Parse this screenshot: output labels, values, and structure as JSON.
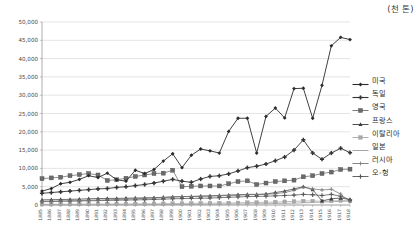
{
  "unit_note": "(천 톤)",
  "chart_data": {
    "type": "line",
    "title": "",
    "subtitle": "",
    "xlabel": "",
    "ylabel": "",
    "unit": "천 톤",
    "ylim": [
      0,
      50000
    ],
    "ytick_step": 5000,
    "ytick_labels": [
      "0",
      "5,000",
      "10,000",
      "15,000",
      "20,000",
      "25,000",
      "30,000",
      "35,000",
      "40,000",
      "45,000",
      "50,000"
    ],
    "grid": true,
    "legend_position": "right",
    "x": [
      1885,
      1886,
      1887,
      1888,
      1889,
      1890,
      1891,
      1892,
      1893,
      1894,
      1895,
      1896,
      1897,
      1898,
      1899,
      1900,
      1901,
      1902,
      1903,
      1904,
      1905,
      1906,
      1907,
      1908,
      1909,
      1910,
      1911,
      1912,
      1913,
      1914,
      1915,
      1916,
      1917,
      1918
    ],
    "xtick_labels": [
      "1885",
      "1886",
      "1887",
      "1888",
      "1889",
      "1890",
      "1891",
      "1892",
      "1893",
      "1894",
      "1895",
      "1896",
      "1897",
      "1898",
      "1899",
      "1900",
      "1901",
      "1902",
      "1903",
      "1904",
      "1905",
      "1906",
      "1907",
      "1908",
      "1909",
      "1910",
      "1911",
      "1912",
      "1913",
      "1914",
      "1915",
      "1916",
      "1917",
      "1918"
    ],
    "series": [
      {
        "name": "미국",
        "marker": "diamond",
        "color": "#2b2b2b",
        "values": [
          3800,
          4500,
          5800,
          6200,
          7000,
          8000,
          7500,
          8700,
          6900,
          6500,
          9500,
          8600,
          9700,
          12000,
          14000,
          10200,
          13600,
          15300,
          14800,
          14200,
          20100,
          23700,
          23700,
          14200,
          24200,
          26500,
          23800,
          31800,
          31900,
          23700,
          32700,
          43500,
          45800,
          45200
        ]
      },
      {
        "name": "독일",
        "marker": "cross-thick",
        "color": "#333333",
        "values": [
          3200,
          3400,
          3600,
          3800,
          4000,
          4200,
          4400,
          4500,
          4800,
          5000,
          5300,
          5600,
          6000,
          6500,
          7000,
          6500,
          6200,
          7100,
          7800,
          8000,
          8500,
          9300,
          10200,
          10600,
          11200,
          12100,
          13100,
          15000,
          17800,
          14200,
          12500,
          14200,
          15500,
          14300
        ]
      },
      {
        "name": "영국",
        "marker": "square",
        "color": "#6b6b6b",
        "values": [
          7200,
          7400,
          7600,
          8000,
          8300,
          8600,
          8200,
          6700,
          6900,
          7300,
          7800,
          8200,
          8600,
          8700,
          9500,
          5000,
          5100,
          5200,
          5200,
          5200,
          5800,
          6400,
          6600,
          5600,
          6000,
          6400,
          6600,
          6800,
          7700,
          8000,
          8600,
          9000,
          9700,
          9800
        ]
      },
      {
        "name": "프랑스",
        "marker": "triangle",
        "color": "#3d3d3d",
        "values": [
          1400,
          1450,
          1500,
          1550,
          1600,
          1700,
          1750,
          1800,
          1800,
          1850,
          1900,
          1950,
          2000,
          2100,
          2200,
          2300,
          2300,
          2400,
          2500,
          2600,
          2700,
          2800,
          2900,
          2900,
          3000,
          3400,
          3800,
          4400,
          5000,
          4200,
          1100,
          1700,
          1900,
          1500
        ]
      },
      {
        "name": "이탈리아",
        "marker": "square-light",
        "color": "#a8a8a8",
        "values": [
          200,
          210,
          220,
          230,
          240,
          250,
          260,
          270,
          280,
          290,
          300,
          320,
          340,
          360,
          400,
          420,
          450,
          480,
          500,
          520,
          550,
          600,
          650,
          700,
          750,
          800,
          900,
          1000,
          1100,
          1100,
          1000,
          1100,
          1200,
          1100
        ]
      },
      {
        "name": "일본",
        "marker": "line-only",
        "color": "#9a9a9a",
        "values": [
          30,
          35,
          40,
          45,
          50,
          55,
          60,
          65,
          70,
          75,
          80,
          90,
          100,
          110,
          120,
          130,
          150,
          170,
          190,
          210,
          240,
          270,
          300,
          330,
          360,
          400,
          450,
          500,
          600,
          700,
          800,
          900,
          1000,
          1100
        ]
      },
      {
        "name": "러시아",
        "marker": "plus",
        "color": "#777777",
        "values": [
          1000,
          1050,
          1100,
          1150,
          1200,
          1300,
          1350,
          1400,
          1500,
          1600,
          1700,
          1800,
          1900,
          2000,
          2200,
          2300,
          2350,
          2400,
          2450,
          2500,
          2600,
          2700,
          2800,
          2850,
          2900,
          3100,
          3400,
          4000,
          4900,
          4400,
          4100,
          4300,
          3000,
          900
        ]
      },
      {
        "name": "오-헝",
        "marker": "plus-bold",
        "color": "#555555",
        "values": [
          900,
          950,
          1000,
          1050,
          1100,
          1150,
          1200,
          1250,
          1300,
          1350,
          1400,
          1450,
          1500,
          1600,
          1700,
          1750,
          1800,
          1850,
          1900,
          2000,
          2100,
          2200,
          2300,
          2350,
          2400,
          2500,
          2600,
          2700,
          2900,
          2800,
          2600,
          2900,
          2400,
          1400
        ]
      }
    ]
  }
}
